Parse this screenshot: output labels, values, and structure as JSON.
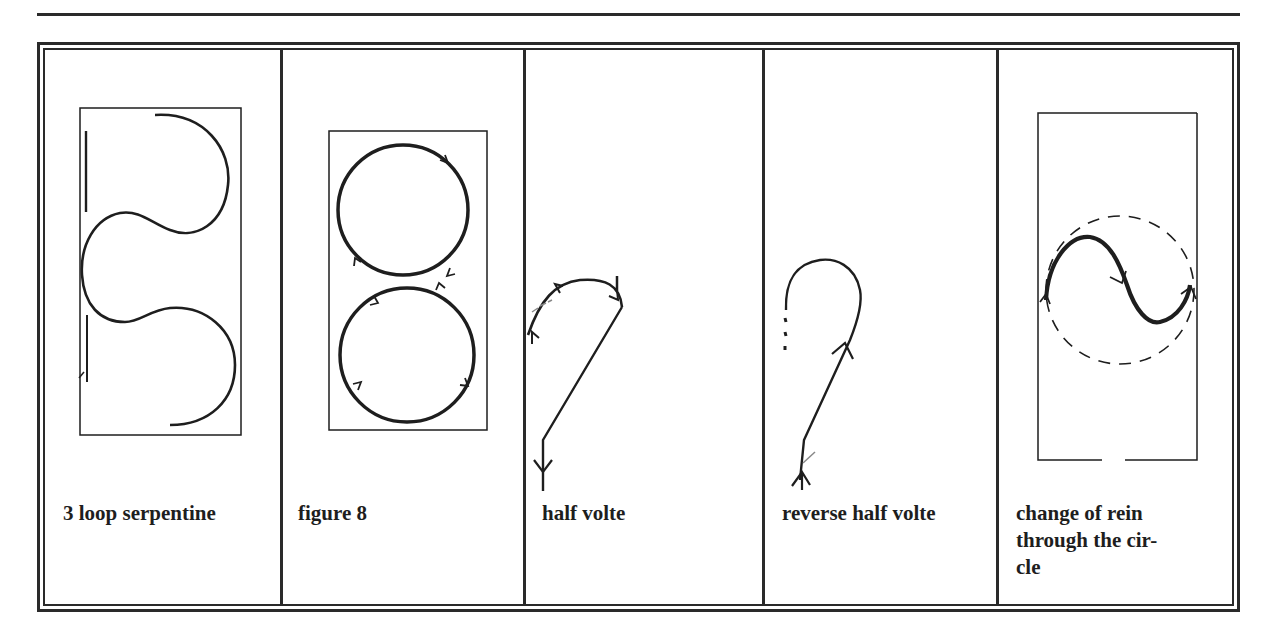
{
  "figure": {
    "panels": [
      {
        "id": "serpentine",
        "label": "3 loop serpentine"
      },
      {
        "id": "figure-eight",
        "label": "figure 8"
      },
      {
        "id": "half-volte",
        "label": "half volte"
      },
      {
        "id": "reverse-half-volte",
        "label": "reverse half volte"
      },
      {
        "id": "change-of-rein",
        "label_lines": [
          "change of rein",
          "through the cir-",
          "cle"
        ]
      }
    ]
  },
  "colors": {
    "ink": "#1e1e1e",
    "paper": "#ffffff"
  }
}
